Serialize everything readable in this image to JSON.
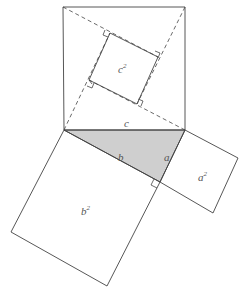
{
  "diagram": {
    "colors": {
      "stroke": "#444444",
      "triangle_fill": "#cfcfcf",
      "label": "#555555",
      "background": "#ffffff"
    },
    "labels": {
      "c_side": "c",
      "b_side": "b",
      "a_side": "a",
      "c_square_base": "c",
      "c_square_exp": "2",
      "b_square_base": "b",
      "b_square_exp": "2",
      "a_square_base": "a",
      "a_square_exp": "2"
    },
    "shapes": {
      "triangle": [
        "64,130",
        "185,130",
        "160,182"
      ],
      "square_c_outer": [
        "63,7",
        "185,7",
        "185,130",
        "64,130"
      ],
      "square_c_inner": [
        "110,33",
        "158,57",
        "137,104",
        "89,80"
      ],
      "square_b": [
        "64,130",
        "160,182",
        "107,286",
        "11,232"
      ],
      "square_a": [
        "185,130",
        "238,158",
        "213,213",
        "160,182"
      ]
    }
  }
}
